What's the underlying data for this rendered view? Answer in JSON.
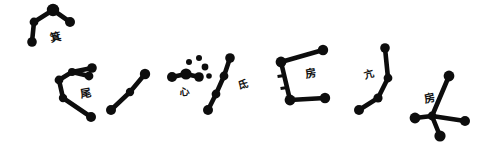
{
  "figure": {
    "background_color": "#ffffff",
    "ink_color": "#0d0d0d",
    "width": 494,
    "height": 148
  },
  "style": {
    "star_color": "#0d0d0d",
    "line_color": "#0d0d0d",
    "label_color": "#111111"
  },
  "chart_data": {
    "type": "scatter",
    "xlabel": "",
    "ylabel": "",
    "xlim": [
      0,
      494
    ],
    "ylim": [
      0,
      148
    ],
    "grid": false,
    "legend": "none",
    "constellations": [
      {
        "id": "ji",
        "label": "箕",
        "label_reading": "Ji",
        "label_meaning": "Winnowing Basket",
        "star_count": 4,
        "label_pos": {
          "x": 50,
          "y": 32,
          "size": 11,
          "rotate": -12
        },
        "stars": [
          {
            "x": 53,
            "y": 10,
            "r": 6.2
          },
          {
            "x": 70,
            "y": 22,
            "r": 5.0
          },
          {
            "x": 34,
            "y": 22,
            "r": 4.4
          },
          {
            "x": 32,
            "y": 42,
            "r": 4.8
          }
        ],
        "links": [
          [
            0,
            1
          ],
          [
            0,
            2
          ],
          [
            2,
            3
          ]
        ]
      },
      {
        "id": "wei-tail",
        "label": "尾",
        "label_reading": "Wei",
        "label_meaning": "Tail",
        "star_count": 6,
        "label_pos": {
          "x": 80,
          "y": 88,
          "size": 11,
          "rotate": -10
        },
        "stars": [
          {
            "x": 92,
            "y": 68,
            "r": 4.8
          },
          {
            "x": 72,
            "y": 72,
            "r": 4.0
          },
          {
            "x": 89,
            "y": 76,
            "r": 4.4
          },
          {
            "x": 59,
            "y": 80,
            "r": 4.4
          },
          {
            "x": 63,
            "y": 98,
            "r": 4.2
          },
          {
            "x": 91,
            "y": 117,
            "r": 5.0
          }
        ],
        "links": [
          [
            0,
            1
          ],
          [
            1,
            2
          ],
          [
            1,
            3
          ],
          [
            3,
            4
          ],
          [
            4,
            5
          ]
        ]
      },
      {
        "id": "xin-lower",
        "label": "",
        "label_reading": "",
        "label_meaning": "three-star chain",
        "star_count": 3,
        "label_pos": null,
        "stars": [
          {
            "x": 145,
            "y": 74,
            "r": 5.2
          },
          {
            "x": 130,
            "y": 92,
            "r": 4.2
          },
          {
            "x": 111,
            "y": 110,
            "r": 5.0
          }
        ],
        "links": [
          [
            0,
            1
          ],
          [
            1,
            2
          ]
        ]
      },
      {
        "id": "xin",
        "label": "心",
        "label_reading": "Xin",
        "label_meaning": "Heart",
        "star_count": 7,
        "label_pos": {
          "x": 180,
          "y": 87,
          "size": 10,
          "rotate": -8
        },
        "stars": [
          {
            "x": 172,
            "y": 77,
            "r": 5.0
          },
          {
            "x": 186,
            "y": 74,
            "r": 5.6
          },
          {
            "x": 199,
            "y": 77,
            "r": 4.8
          },
          {
            "x": 189,
            "y": 62,
            "r": 3.0
          },
          {
            "x": 199,
            "y": 58,
            "r": 3.0
          },
          {
            "x": 205,
            "y": 67,
            "r": 3.4
          },
          {
            "x": 209,
            "y": 76,
            "r": 2.8
          }
        ],
        "links": [
          [
            0,
            1
          ],
          [
            1,
            2
          ]
        ]
      },
      {
        "id": "di",
        "label": "氐",
        "label_reading": "Di",
        "label_meaning": "Root",
        "star_count": 4,
        "label_pos": {
          "x": 238,
          "y": 80,
          "size": 10,
          "rotate": -14
        },
        "stars": [
          {
            "x": 230,
            "y": 58,
            "r": 4.8
          },
          {
            "x": 224,
            "y": 76,
            "r": 4.4
          },
          {
            "x": 216,
            "y": 94,
            "r": 4.4
          },
          {
            "x": 208,
            "y": 110,
            "r": 5.0
          }
        ],
        "links": [
          [
            0,
            1
          ],
          [
            1,
            2
          ],
          [
            2,
            3
          ]
        ]
      },
      {
        "id": "fang-box",
        "label": "房",
        "label_reading": "Fang",
        "label_meaning": "Room",
        "star_count": 4,
        "label_pos": {
          "x": 305,
          "y": 68,
          "size": 11,
          "rotate": -10
        },
        "stars": [
          {
            "x": 323,
            "y": 50,
            "r": 5.2
          },
          {
            "x": 281,
            "y": 62,
            "r": 5.4
          },
          {
            "x": 290,
            "y": 100,
            "r": 5.4
          },
          {
            "x": 325,
            "y": 98,
            "r": 5.2
          }
        ],
        "links": [
          [
            0,
            1
          ],
          [
            1,
            2
          ],
          [
            2,
            3
          ]
        ],
        "ticks": [
          {
            "x": 281,
            "y": 76,
            "w": 7,
            "h": 3.2,
            "rotate": -8
          },
          {
            "x": 284,
            "y": 88,
            "w": 7,
            "h": 3.2,
            "rotate": -8
          }
        ]
      },
      {
        "id": "kang",
        "label": "亢",
        "label_reading": "Kang",
        "label_meaning": "Neck",
        "star_count": 4,
        "label_pos": {
          "x": 364,
          "y": 70,
          "size": 10,
          "rotate": -16
        },
        "stars": [
          {
            "x": 385,
            "y": 48,
            "r": 4.8
          },
          {
            "x": 388,
            "y": 78,
            "r": 4.4
          },
          {
            "x": 378,
            "y": 98,
            "r": 4.6
          },
          {
            "x": 359,
            "y": 110,
            "r": 5.0
          }
        ],
        "links": [
          [
            0,
            1
          ],
          [
            1,
            2
          ],
          [
            2,
            3
          ]
        ]
      },
      {
        "id": "fang-cross",
        "label": "房",
        "label_reading": "Fang",
        "label_meaning": "Room",
        "star_count": 5,
        "label_pos": {
          "x": 424,
          "y": 93,
          "size": 11,
          "rotate": -12
        },
        "stars": [
          {
            "x": 449,
            "y": 76,
            "r": 5.4
          },
          {
            "x": 415,
            "y": 118,
            "r": 5.4
          },
          {
            "x": 432,
            "y": 116,
            "r": 4.4
          },
          {
            "x": 465,
            "y": 121,
            "r": 5.0
          },
          {
            "x": 440,
            "y": 136,
            "r": 5.6
          }
        ],
        "links": [
          [
            0,
            2
          ],
          [
            1,
            2
          ],
          [
            2,
            3
          ],
          [
            2,
            4
          ]
        ]
      }
    ]
  }
}
